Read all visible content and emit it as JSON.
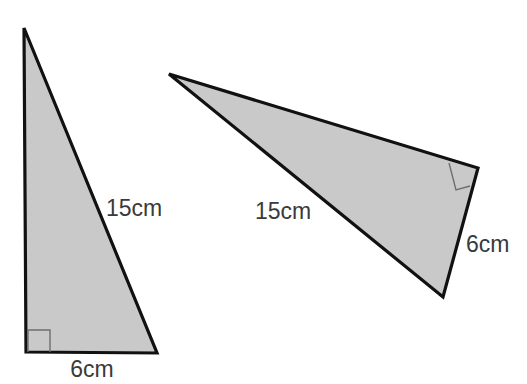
{
  "figure": {
    "canvas": {
      "width": 527,
      "height": 384,
      "background": "#ffffff"
    },
    "style": {
      "fill_color": "#c9c9c9",
      "stroke_color": "#111111",
      "stroke_width": 3.2,
      "label_color": "#3a3a3a",
      "right_angle_color": "#6e6e6e",
      "right_angle_width": 1.4,
      "label_font_size": 23
    },
    "shapes": [
      {
        "name": "left-triangle",
        "kind": "right-triangle",
        "points": "24,28 26,352 157,353",
        "right_angle_at": "bottom-left",
        "right_angle_marker": "28,352 28,330 50,330 50,352",
        "labels": [
          {
            "name": "hypotenuse",
            "text": "15cm",
            "x": 106,
            "y": 216,
            "anchor": "start"
          },
          {
            "name": "base",
            "text": "6cm",
            "x": 92,
            "y": 377,
            "anchor": "middle"
          }
        ]
      },
      {
        "name": "right-triangle",
        "kind": "right-triangle",
        "points": "169,74 478,168 443,297",
        "right_angle_at": "upper-right",
        "right_angle_marker": "449,163 456,190 470,186",
        "labels": [
          {
            "name": "long-leg",
            "text": "15cm",
            "x": 255,
            "y": 219,
            "anchor": "start"
          },
          {
            "name": "short-leg",
            "text": "6cm",
            "x": 466,
            "y": 252,
            "anchor": "start"
          }
        ]
      }
    ]
  }
}
